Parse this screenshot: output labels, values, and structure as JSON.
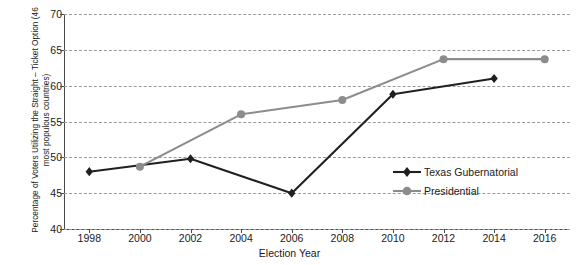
{
  "chart_data": {
    "type": "line",
    "title": "",
    "xlabel": "Election Year",
    "ylabel": "Percentage of Voters Utilizing the Straight – Ticket Option (46 most populous countries)",
    "x": [
      1998,
      2000,
      2002,
      2004,
      2006,
      2008,
      2010,
      2012,
      2014,
      2016
    ],
    "categories": [
      "1998",
      "2000",
      "2002",
      "2004",
      "2006",
      "2008",
      "2010",
      "2012",
      "2014",
      "2016"
    ],
    "ylim": [
      40,
      70
    ],
    "xlim": [
      1997,
      2017
    ],
    "yticks": [
      40,
      45,
      50,
      55,
      60,
      65,
      70
    ],
    "grid": "horizontal-dashed",
    "legend_position": "bottom-right-inside",
    "series": [
      {
        "name": "Texas Gubernatorial",
        "color": "#231f20",
        "marker": "diamond",
        "x": [
          1998,
          2002,
          2006,
          2010,
          2014
        ],
        "values": [
          48.0,
          49.8,
          45.0,
          58.8,
          61.0
        ]
      },
      {
        "name": "Presidential",
        "color": "#8c8c8c",
        "marker": "circle",
        "x": [
          2000,
          2004,
          2008,
          2012,
          2016
        ],
        "values": [
          48.7,
          56.0,
          58.0,
          63.7,
          63.7
        ]
      }
    ]
  },
  "axes": {
    "ylabel": "Percentage of Voters Utilizing the Straight – Ticket Option (46 most populous countries)",
    "xlabel": "Election Year",
    "ytick_labels": [
      "70",
      "65",
      "60",
      "55",
      "50",
      "45",
      "40"
    ],
    "xtick_labels": [
      "1998",
      "2000",
      "2002",
      "2004",
      "2006",
      "2008",
      "2010",
      "2012",
      "2014",
      "2016"
    ]
  },
  "legend": {
    "items": [
      {
        "label": "Texas Gubernatorial",
        "color": "#231f20",
        "marker": "diamond-icon"
      },
      {
        "label": "Presidential",
        "color": "#8c8c8c",
        "marker": "circle-icon"
      }
    ]
  },
  "colors": {
    "gubernatorial": "#231f20",
    "presidential": "#8c8c8c",
    "gridline": "#9a9a9a",
    "axis": "#4a4a4a",
    "background": "#ffffff"
  }
}
